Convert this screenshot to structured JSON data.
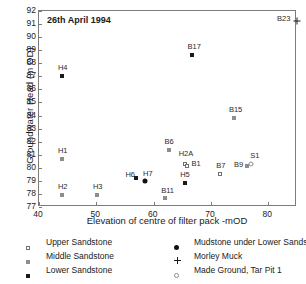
{
  "chart_data": {
    "type": "scatter",
    "title": "26th April 1994",
    "xlabel": "Elevation of centre of filter pack -mOD",
    "ylabel": "Groundwater Head (m OD)",
    "xlim": [
      40,
      85
    ],
    "ylim": [
      77,
      92
    ],
    "xticks": [
      40,
      50,
      60,
      70,
      80
    ],
    "yticks": [
      77,
      78,
      79,
      80,
      81,
      82,
      83,
      84,
      85,
      86,
      87,
      88,
      89,
      90,
      91,
      92
    ],
    "grid": false,
    "legend_position": "below-plot",
    "series": [
      {
        "name": "Upper Sandstone",
        "marker": "open-square",
        "points": [
          {
            "label": "H2A",
            "x": 65.4,
            "y": 80.3
          },
          {
            "label": "B1",
            "x": 65.9,
            "y": 80.15
          },
          {
            "label": "B7",
            "x": 71.6,
            "y": 79.5
          }
        ]
      },
      {
        "name": "Middle Sandstone",
        "marker": "grey-square",
        "points": [
          {
            "label": "H1",
            "x": 44.0,
            "y": 80.7
          },
          {
            "label": "H2",
            "x": 44.0,
            "y": 77.9
          },
          {
            "label": "H3",
            "x": 50.1,
            "y": 77.9
          },
          {
            "label": "B11",
            "x": 62.0,
            "y": 77.7
          },
          {
            "label": "B6",
            "x": 62.6,
            "y": 81.35
          },
          {
            "label": "B15",
            "x": 74.0,
            "y": 83.8
          },
          {
            "label": "B9",
            "x": 76.3,
            "y": 80.1
          }
        ]
      },
      {
        "name": "Lower Sandstone",
        "marker": "filled-square",
        "points": [
          {
            "label": "H4",
            "x": 44.0,
            "y": 87.05
          },
          {
            "label": "H6",
            "x": 57.0,
            "y": 79.2
          },
          {
            "label": "H5",
            "x": 65.5,
            "y": 78.85
          },
          {
            "label": "B17",
            "x": 66.6,
            "y": 88.6
          }
        ]
      },
      {
        "name": "Mudstone under Lower Sandstone",
        "marker": "filled-circle",
        "points": [
          {
            "label": "H7",
            "x": 58.5,
            "y": 79.0
          }
        ]
      },
      {
        "name": "Morley Muck",
        "marker": "plus",
        "points": [
          {
            "label": "B23",
            "x": 85.0,
            "y": 91.2
          }
        ]
      },
      {
        "name": "Made Ground, Tar Pit 1",
        "marker": "open-circle",
        "points": [
          {
            "label": "S1",
            "x": 77.0,
            "y": 80.3
          }
        ]
      }
    ]
  },
  "legend": {
    "entries": [
      {
        "label": "Upper Sandstone",
        "marker": "open-square"
      },
      {
        "label": "Middle Sandstone",
        "marker": "grey-square"
      },
      {
        "label": "Lower Sandstone",
        "marker": "filled-square"
      },
      {
        "label": "Mudstone under Lower Sandstone",
        "marker": "filled-circle"
      },
      {
        "label": "Morley Muck",
        "marker": "plus"
      },
      {
        "label": "Made Ground, Tar Pit 1",
        "marker": "open-circle"
      }
    ]
  },
  "colors": {
    "axis": "#7c7c7c",
    "text": "#1a1a1a",
    "marker_dark": "#1a1a1a",
    "marker_grey": "#8d8d8d",
    "marker_open_border": "#6f6f6f",
    "background": "#ffffff"
  }
}
